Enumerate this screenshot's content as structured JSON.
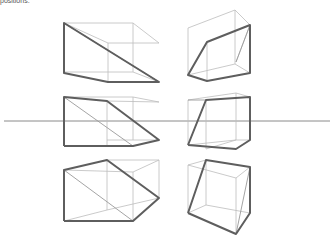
{
  "caption": "positions.",
  "figure": {
    "horizon_line": {
      "x1": 4,
      "y1": 121,
      "x2": 330,
      "y2": 121
    },
    "colors": {
      "thin_line": "#bdbdbd",
      "bold_line": "#5e5e5e",
      "horizon": "#8a8a8a"
    },
    "boxes": [
      {
        "id": "top-left",
        "thin": "M64,23 L133,23 L159,43 M133,23 L133,72 M64,72 L133,72 L159,82 M108,43 L159,43 M108,43 L108,82 M108,43 L64,23",
        "diag": "M64,23 L159,82",
        "bold": "M64,23 L159,82 L108,82 L64,73 Z"
      },
      {
        "id": "top-right",
        "thin": "M188,28 L235,10 L250,25 M188,28 L188,75 M235,10 L235,64 M188,75 L235,64 L250,73 M207,42 L207,81 M235,64 L235,64 M250,25 L236,62",
        "diag": "M250,25 L236,62",
        "bold": "M188,75 L207,42 L250,25 L250,73 L207,81 Z"
      },
      {
        "id": "middle-left",
        "thin": "M64,97 L133,97 L159,102 M107,101 L159,102 M107,101 L107,146 M133,97 L133,140 M107,140 L159,140 M64,146 L107,146",
        "diag": "M64,97 L133,146",
        "bold": "M64,146 L64,97 L107,101 L159,140 L133,146 L64,146"
      },
      {
        "id": "middle-right",
        "thin": "M188,100 L236,93 L250,97 M188,100 L188,145 M236,93 L236,140 M206,100 L206,149 M188,145 L236,140 L250,140 M206,149 L236,140",
        "diag": "M188,100 L206,100",
        "bold": "M188,145 L206,100 L250,97 L250,140 L236,149 L188,145"
      },
      {
        "id": "bottom-left",
        "thin": "M107,160 L159,160 M107,160 L107,210 M159,160 L159,198 M64,170 L133,172 L159,160 M133,172 L133,221 M64,221 L107,210 L159,198",
        "diag": "M64,170 L133,221",
        "bold": "M64,221 L64,170 L107,160 L159,198 L133,221 L64,221"
      },
      {
        "id": "bottom-right",
        "thin": "M188,165 L206,160 M188,165 L236,178 L250,167 M236,178 L236,234 M188,165 L188,213 M188,213 L206,205 L250,213 M206,160 L206,205",
        "diag": "M236,234 L250,167",
        "bold": "M188,213 L206,160 L250,167 L250,213 L236,234 L188,213"
      }
    ]
  }
}
